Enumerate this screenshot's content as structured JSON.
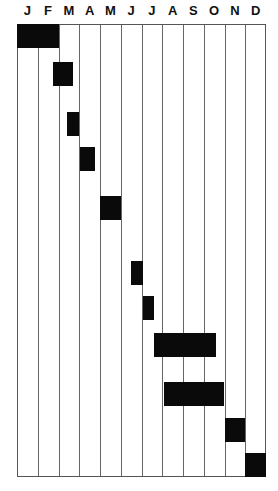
{
  "chart_data": {
    "type": "gantt",
    "title": "",
    "xlabel": "",
    "ylabel": "",
    "categories": [
      "J",
      "F",
      "M",
      "A",
      "M",
      "J",
      "J",
      "A",
      "S",
      "O",
      "N",
      "D"
    ],
    "grid": {
      "vertical": true,
      "horizontal": false
    },
    "tasks": [
      {
        "id": 1,
        "start": 0.0,
        "end": 2.0,
        "y_top": 24
      },
      {
        "id": 2,
        "start": 1.75,
        "end": 2.7,
        "y_top": 62
      },
      {
        "id": 3,
        "start": 2.4,
        "end": 3.0,
        "y_top": 112
      },
      {
        "id": 4,
        "start": 3.05,
        "end": 3.75,
        "y_top": 147
      },
      {
        "id": 5,
        "start": 4.0,
        "end": 5.0,
        "y_top": 196
      },
      {
        "id": 6,
        "start": 5.5,
        "end": 6.05,
        "y_top": 261
      },
      {
        "id": 7,
        "start": 6.05,
        "end": 6.6,
        "y_top": 296
      },
      {
        "id": 8,
        "start": 6.6,
        "end": 9.6,
        "y_top": 333
      },
      {
        "id": 9,
        "start": 7.1,
        "end": 10.0,
        "y_top": 382
      },
      {
        "id": 10,
        "start": 10.0,
        "end": 11.0,
        "y_top": 418
      },
      {
        "id": 11,
        "start": 11.0,
        "end": 12.0,
        "y_top": 453
      }
    ]
  }
}
